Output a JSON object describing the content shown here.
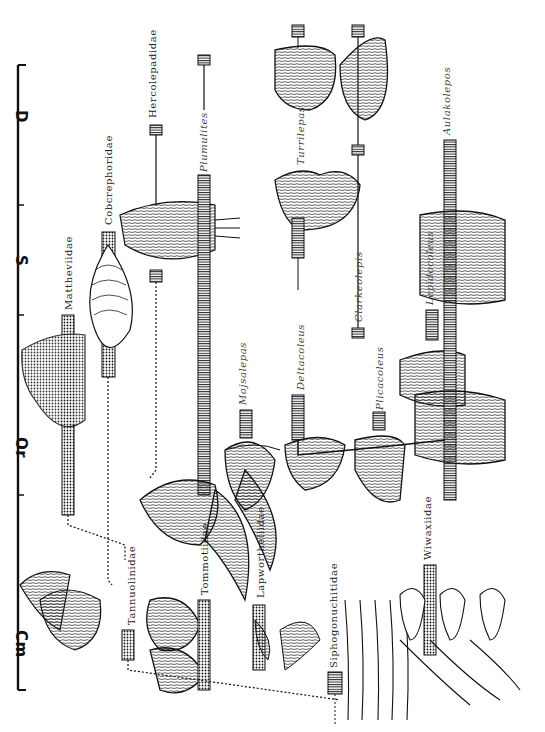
{
  "timescale": {
    "periods": [
      {
        "label": "D",
        "name": "Devonian",
        "y": 118
      },
      {
        "label": "S",
        "name": "Silurian",
        "y": 262
      },
      {
        "label": "Or",
        "name": "Ordovician",
        "y": 445
      },
      {
        "label": "Cm",
        "name": "Cambrian",
        "y": 640
      }
    ],
    "tick_y": [
      65,
      205,
      315,
      495,
      690
    ]
  },
  "families": [
    {
      "label": "Mattheviidae",
      "x": 67,
      "y": 270
    },
    {
      "label": "Cobcrephoridae",
      "x": 107,
      "y": 205
    },
    {
      "label": "Hercolepadidae",
      "x": 150,
      "y": 112
    },
    {
      "label": "Tannuolinidae",
      "x": 130,
      "y": 625
    },
    {
      "label": "Tommotiidae",
      "x": 203,
      "y": 590
    },
    {
      "label": "Lapworthellidae",
      "x": 258,
      "y": 595
    },
    {
      "label": "Siphogonuchitidae",
      "x": 330,
      "y": 690
    },
    {
      "label": "Wiwaxiidae",
      "x": 428,
      "y": 560
    }
  ],
  "genera": [
    {
      "label": "Plumulites",
      "x": 203,
      "y": 175
    },
    {
      "label": "Turrilepas",
      "x": 298,
      "y": 160
    },
    {
      "label": "Mojsalepas",
      "x": 242,
      "y": 410
    },
    {
      "label": "Deltacoleus",
      "x": 298,
      "y": 390
    },
    {
      "label": "Clarkeolepis",
      "x": 358,
      "y": 330
    },
    {
      "label": "Plicacoleus",
      "x": 378,
      "y": 420
    },
    {
      "label": "Lepidocoleus",
      "x": 428,
      "y": 310
    },
    {
      "label": "Aulakolepos",
      "x": 448,
      "y": 140
    }
  ],
  "legend": {
    "stippled_bar": "family range",
    "striped_bar": "genus range",
    "dotted_line": "inferred relationship"
  }
}
